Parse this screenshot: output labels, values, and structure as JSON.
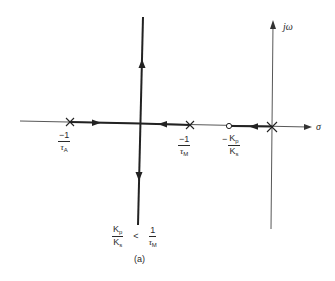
{
  "figure": {
    "type": "root-locus",
    "caption": "(a)",
    "axes": {
      "imag_label": "jω",
      "real_label": "σ"
    },
    "poles": [
      {
        "name": "pole-tau-a",
        "label_num": "−1",
        "label_den_sym": "τ",
        "label_den_sub": "A"
      },
      {
        "name": "pole-tau-m",
        "label_num": "−1",
        "label_den_sym": "τ",
        "label_den_sub": "M"
      },
      {
        "name": "pole-origin"
      }
    ],
    "zeros": [
      {
        "name": "zero-kp-ks",
        "sign": "−",
        "label_num_sym": "K",
        "label_num_sub": "p",
        "label_den_sym": "K",
        "label_den_sub": "s"
      }
    ],
    "condition": {
      "lhs_num_sym": "K",
      "lhs_num_sub": "p",
      "lhs_den_sym": "K",
      "lhs_den_sub": "s",
      "op": "<",
      "rhs_num": "1",
      "rhs_den_sym": "τ",
      "rhs_den_sub": "M"
    }
  }
}
